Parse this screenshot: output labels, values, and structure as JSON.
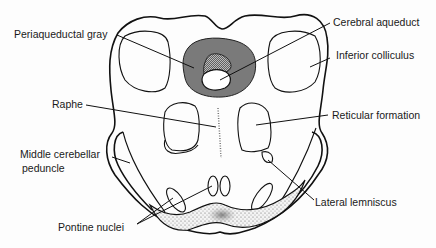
{
  "diagram": {
    "type": "anatomical cross-section",
    "colors": {
      "outline": "#111111",
      "periaqueductal_gray_fill": "#7a7a7a",
      "background": "#fdfdfd",
      "label_text": "#1a1a1a"
    },
    "labels": {
      "periaqueductal_gray": "Periaqueductal gray",
      "cerebral_aqueduct": "Cerebral aqueduct",
      "inferior_colliculus": "Inferior colliculus",
      "raphe": "Raphe",
      "reticular_formation": "Reticular formation",
      "middle_cerebellar_peduncle_line1": "Middle cerebellar",
      "middle_cerebellar_peduncle_line2": "peduncle",
      "lateral_lemniscus": "Lateral lemniscus",
      "pontine_nuclei": "Pontine nuclei"
    }
  }
}
